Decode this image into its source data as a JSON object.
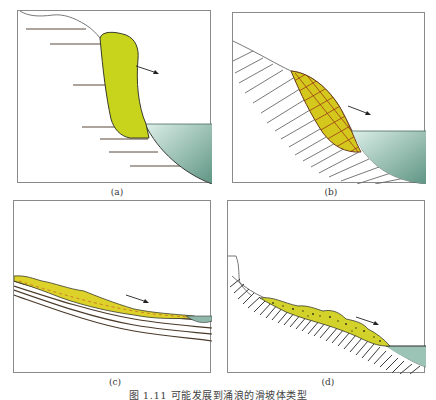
{
  "figure": {
    "caption": "图 1.11  可能发展到涌浪的滑坡体类型",
    "colors": {
      "slide_body": "#c8d41c",
      "slide_body_b": "#d8c41c",
      "water_top": "#cfe5de",
      "water_deep": "#6f9e8e",
      "outline": "#3a3a2a",
      "bedding": "#5a4a3a",
      "hatch": "#6a6a6a"
    },
    "panels": [
      {
        "id": "a",
        "label": "(a)",
        "description": "rock fall block with horizontal bedding into water",
        "arrow": "movement-direction"
      },
      {
        "id": "b",
        "label": "(b)",
        "description": "rotational slide lens on hatched slope into water",
        "arrow": "movement-direction"
      },
      {
        "id": "c",
        "label": "(c)",
        "description": "thin translational slide on layered beds",
        "arrow": "movement-direction"
      },
      {
        "id": "d",
        "label": "(d)",
        "description": "debris flow on hatched slope into water",
        "arrow": "movement-direction"
      }
    ]
  }
}
